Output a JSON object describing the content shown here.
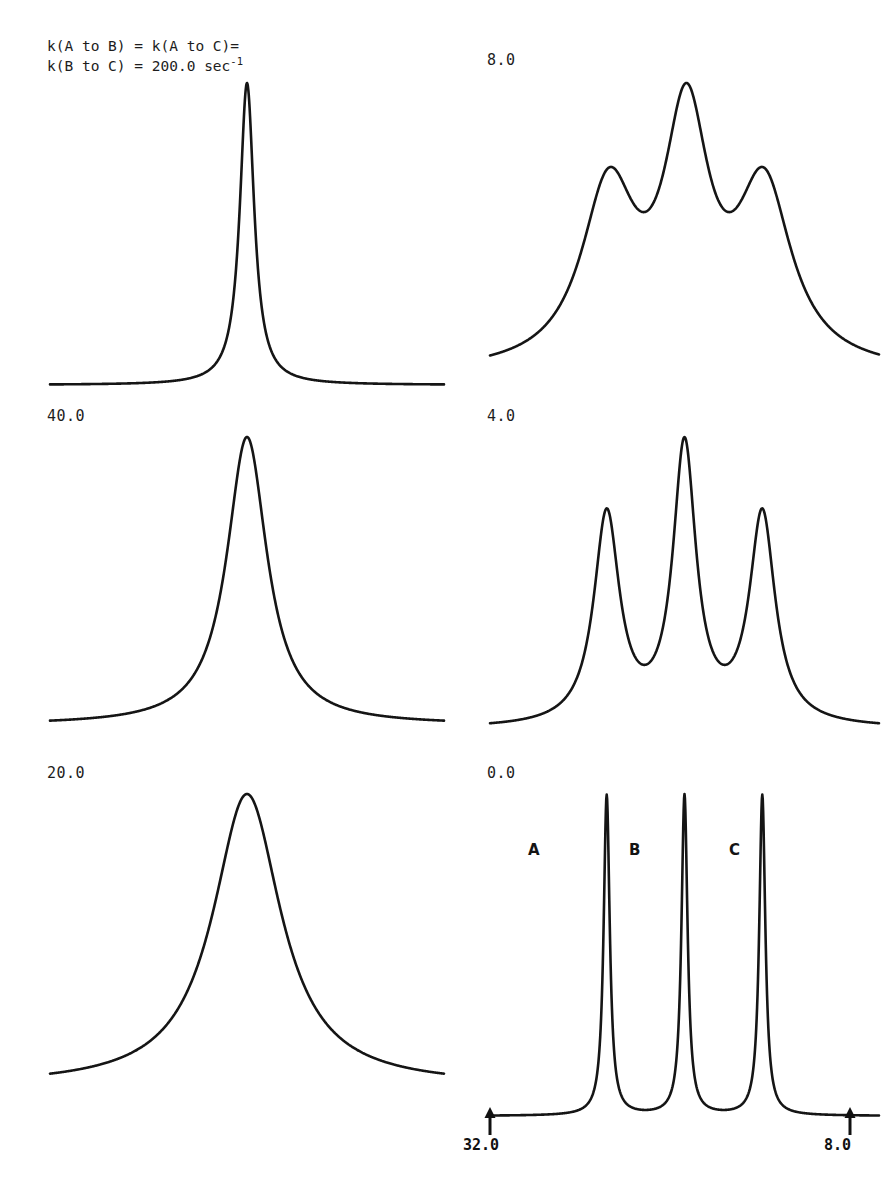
{
  "figure": {
    "caption_line1": "k(A to B) = k(A to C)=",
    "caption_line2_pre": "k(B to C) = 200.0 sec",
    "caption_line2_exp": "-1",
    "ink_color": "#151515",
    "background_color": "#ffffff"
  },
  "panels": [
    {
      "id": "p200",
      "rate_label": "200.0",
      "label_text": "",
      "column": "left",
      "row": 0
    },
    {
      "id": "p40",
      "rate_label": "40.0",
      "label_text": "40.0",
      "column": "left",
      "row": 1
    },
    {
      "id": "p20",
      "rate_label": "20.0",
      "label_text": "20.0",
      "column": "left",
      "row": 2
    },
    {
      "id": "p8",
      "rate_label": "8.0",
      "label_text": "8.0",
      "column": "right",
      "row": 0
    },
    {
      "id": "p4",
      "rate_label": "4.0",
      "label_text": "4.0",
      "column": "right",
      "row": 1
    },
    {
      "id": "p0",
      "rate_label": "0.0",
      "label_text": "0.0",
      "column": "right",
      "row": 2
    }
  ],
  "axis": {
    "left_endpoint": "32.0",
    "right_endpoint": "8.0",
    "direction": "decreasing-left-to-right"
  },
  "peak_labels": [
    {
      "letter": "A",
      "x": 528,
      "y": 841
    },
    {
      "letter": "B",
      "x": 629,
      "y": 841
    },
    {
      "letter": "C",
      "x": 729,
      "y": 841
    }
  ],
  "chart_data": {
    "type": "line",
    "xlabel": "",
    "ylabel": "",
    "x_axis_left_value": 32.0,
    "x_axis_right_value": 8.0,
    "grid": false,
    "legend": "none",
    "site_labels": [
      "A",
      "B",
      "C"
    ],
    "site_centers_ppm": [
      26.0,
      20.0,
      14.0
    ],
    "rate_units": "sec^-1",
    "panels": [
      {
        "id": "p200",
        "exchange_rate": 200.0,
        "regime": "fast exchange",
        "peaks": [
          {
            "center": 0.5,
            "width": 0.022,
            "amplitude": 1.0
          }
        ],
        "description": "single sharp coalesced line at the population-averaged frequency"
      },
      {
        "id": "p40",
        "exchange_rate": 40.0,
        "regime": "fast exchange, broadened",
        "peaks": [
          {
            "center": 0.5,
            "width": 0.062,
            "amplitude": 1.0
          }
        ],
        "description": "single broadened line"
      },
      {
        "id": "p20",
        "exchange_rate": 20.0,
        "regime": "near coalescence",
        "peaks": [
          {
            "center": 0.5,
            "width": 0.105,
            "amplitude": 1.0
          }
        ],
        "description": "single broad line, wider than the 40.0 trace"
      },
      {
        "id": "p8",
        "exchange_rate": 8.0,
        "regime": "intermediate exchange",
        "peaks": [
          {
            "center": 0.305,
            "width": 0.085,
            "amplitude": 0.64
          },
          {
            "center": 0.505,
            "width": 0.07,
            "amplitude": 0.88
          },
          {
            "center": 0.705,
            "width": 0.085,
            "amplitude": 0.64
          }
        ],
        "description": "broad envelope with unresolved shoulders on both flanks"
      },
      {
        "id": "p4",
        "exchange_rate": 4.0,
        "regime": "slow-intermediate exchange",
        "peaks": [
          {
            "center": 0.3,
            "width": 0.04,
            "amplitude": 0.7
          },
          {
            "center": 0.5,
            "width": 0.036,
            "amplitude": 0.92
          },
          {
            "center": 0.7,
            "width": 0.04,
            "amplitude": 0.7
          }
        ],
        "description": "three partially resolved maxima, centre peak tallest"
      },
      {
        "id": "p0",
        "exchange_rate": 0.0,
        "regime": "slow exchange limit",
        "peaks": [
          {
            "center": 0.3,
            "width": 0.0095,
            "amplitude": 1.0
          },
          {
            "center": 0.5,
            "width": 0.0095,
            "amplitude": 1.0
          },
          {
            "center": 0.7,
            "width": 0.0095,
            "amplitude": 1.0
          }
        ],
        "description": "three sharp fully resolved lines labelled A, B and C"
      }
    ]
  }
}
